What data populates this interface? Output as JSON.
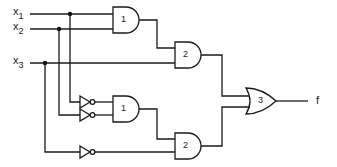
{
  "diagram": {
    "type": "logic-circuit",
    "inputs": [
      {
        "name": "x",
        "sub": "1"
      },
      {
        "name": "x",
        "sub": "2"
      },
      {
        "name": "x",
        "sub": "3"
      }
    ],
    "output": {
      "label": "f"
    },
    "gates": [
      {
        "id": "and-1-top",
        "kind": "AND",
        "label": "1"
      },
      {
        "id": "and-2-top",
        "kind": "AND",
        "label": "2"
      },
      {
        "id": "or-3",
        "kind": "OR",
        "label": "3"
      },
      {
        "id": "and-1-bottom",
        "kind": "AND",
        "label": "1"
      },
      {
        "id": "and-2-bottom",
        "kind": "AND",
        "label": "2"
      },
      {
        "id": "not-x1",
        "kind": "NOT",
        "label": ""
      },
      {
        "id": "not-x2",
        "kind": "NOT",
        "label": ""
      },
      {
        "id": "not-x3",
        "kind": "NOT",
        "label": ""
      }
    ],
    "colors": {
      "line": "#1a1a1a",
      "background": "#ffffff"
    }
  }
}
